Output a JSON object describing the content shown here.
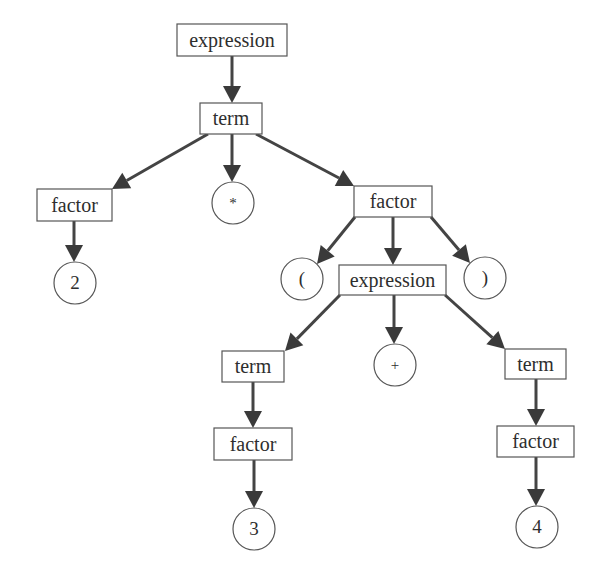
{
  "diagram": {
    "colors": {
      "line": "#444444",
      "arrowhead": "#3a3a3a",
      "node_border": "#555555",
      "text": "#2e2e2e",
      "background": "#ffffff"
    },
    "nodes": [
      {
        "id": "n0",
        "label": "expression",
        "shape": "box",
        "x": 177,
        "y": 24,
        "w": 110,
        "h": 32
      },
      {
        "id": "n1",
        "label": "term",
        "shape": "box",
        "x": 200,
        "y": 103,
        "w": 62,
        "h": 31
      },
      {
        "id": "n2",
        "label": "factor",
        "shape": "box",
        "x": 37,
        "y": 189,
        "w": 75,
        "h": 32
      },
      {
        "id": "n3",
        "label": "*",
        "shape": "circle",
        "cx": 233,
        "cy": 203,
        "r": 21
      },
      {
        "id": "n4",
        "label": "factor",
        "shape": "box",
        "x": 354,
        "y": 186,
        "w": 78,
        "h": 31
      },
      {
        "id": "n5",
        "label": "2",
        "shape": "circle",
        "cx": 75,
        "cy": 283,
        "r": 21
      },
      {
        "id": "n6",
        "label": "(",
        "shape": "circle",
        "cx": 302,
        "cy": 279,
        "r": 21
      },
      {
        "id": "n7",
        "label": "expression",
        "shape": "box",
        "x": 339,
        "y": 265,
        "w": 107,
        "h": 30
      },
      {
        "id": "n8",
        "label": ")",
        "shape": "circle",
        "cx": 485,
        "cy": 278,
        "r": 21
      },
      {
        "id": "n9",
        "label": "term",
        "shape": "box",
        "x": 222,
        "y": 351,
        "w": 62,
        "h": 31
      },
      {
        "id": "n10",
        "label": "+",
        "shape": "circle",
        "cx": 395,
        "cy": 365,
        "r": 21
      },
      {
        "id": "n11",
        "label": "term",
        "shape": "box",
        "x": 505,
        "y": 349,
        "w": 61,
        "h": 30
      },
      {
        "id": "n12",
        "label": "factor",
        "shape": "box",
        "x": 214,
        "y": 428,
        "w": 78,
        "h": 32
      },
      {
        "id": "n13",
        "label": "factor",
        "shape": "box",
        "x": 497,
        "y": 426,
        "w": 77,
        "h": 31
      },
      {
        "id": "n14",
        "label": "3",
        "shape": "circle",
        "cx": 254,
        "cy": 529,
        "r": 21
      },
      {
        "id": "n15",
        "label": "4",
        "shape": "circle",
        "cx": 537,
        "cy": 527,
        "r": 21
      }
    ],
    "edges": [
      {
        "from": "n0",
        "to": "n1",
        "x1": 232,
        "y1": 56,
        "x2": 232,
        "y2": 103
      },
      {
        "from": "n1",
        "to": "n2",
        "x1": 208,
        "y1": 134,
        "x2": 112,
        "y2": 189
      },
      {
        "from": "n1",
        "to": "n3",
        "x1": 232,
        "y1": 134,
        "x2": 232,
        "y2": 182
      },
      {
        "from": "n1",
        "to": "n4",
        "x1": 256,
        "y1": 134,
        "x2": 354,
        "y2": 186
      },
      {
        "from": "n2",
        "to": "n5",
        "x1": 74,
        "y1": 221,
        "x2": 74,
        "y2": 262
      },
      {
        "from": "n4",
        "to": "n6",
        "x1": 355,
        "y1": 217,
        "x2": 317,
        "y2": 264
      },
      {
        "from": "n4",
        "to": "n7",
        "x1": 393,
        "y1": 217,
        "x2": 393,
        "y2": 265
      },
      {
        "from": "n4",
        "to": "n8",
        "x1": 431,
        "y1": 217,
        "x2": 470,
        "y2": 263
      },
      {
        "from": "n7",
        "to": "n9",
        "x1": 340,
        "y1": 295,
        "x2": 285,
        "y2": 351
      },
      {
        "from": "n7",
        "to": "n10",
        "x1": 394,
        "y1": 295,
        "x2": 394,
        "y2": 344
      },
      {
        "from": "n7",
        "to": "n11",
        "x1": 445,
        "y1": 295,
        "x2": 505,
        "y2": 349
      },
      {
        "from": "n9",
        "to": "n12",
        "x1": 253,
        "y1": 382,
        "x2": 253,
        "y2": 428
      },
      {
        "from": "n11",
        "to": "n13",
        "x1": 536,
        "y1": 379,
        "x2": 536,
        "y2": 426
      },
      {
        "from": "n12",
        "to": "n14",
        "x1": 254,
        "y1": 460,
        "x2": 254,
        "y2": 508
      },
      {
        "from": "n13",
        "to": "n15",
        "x1": 536,
        "y1": 457,
        "x2": 536,
        "y2": 506
      }
    ]
  }
}
